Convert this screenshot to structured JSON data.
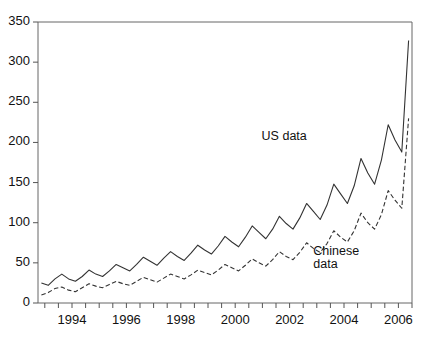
{
  "chart_data": {
    "type": "line",
    "title": "",
    "xlabel": "",
    "ylabel": "",
    "xlim": [
      1992.75,
      2006.5
    ],
    "ylim": [
      0,
      350
    ],
    "grid": false,
    "legend_position": "inline-annotation",
    "y_ticks": [
      0,
      50,
      100,
      150,
      200,
      250,
      300,
      350
    ],
    "y_tick_labels": [
      "0",
      "50",
      "100",
      "150",
      "200",
      "250",
      "300",
      "350"
    ],
    "x_ticks": [
      1994,
      1996,
      1998,
      2000,
      2002,
      2004,
      2006
    ],
    "x_tick_labels": [
      "1994",
      "1996",
      "1998",
      "2000",
      "2002",
      "2004",
      "2006"
    ],
    "x_minor_ticks": [
      1993,
      1993.5,
      1994.5,
      1995,
      1995.5,
      1996.5,
      1997,
      1997.5,
      1998.5,
      1999,
      1999.5,
      2000.5,
      2001,
      2001.5,
      2002.5,
      2003,
      2003.5,
      2004.5,
      2005,
      2005.5,
      2006.5
    ],
    "x": [
      1992.875,
      1993.125,
      1993.375,
      1993.625,
      1993.875,
      1994.125,
      1994.375,
      1994.625,
      1994.875,
      1995.125,
      1995.375,
      1995.625,
      1995.875,
      1996.125,
      1996.375,
      1996.625,
      1996.875,
      1997.125,
      1997.375,
      1997.625,
      1997.875,
      1998.125,
      1998.375,
      1998.625,
      1998.875,
      1999.125,
      1999.375,
      1999.625,
      1999.875,
      2000.125,
      2000.375,
      2000.625,
      2000.875,
      2001.125,
      2001.375,
      2001.625,
      2001.875,
      2002.125,
      2002.375,
      2002.625,
      2002.875,
      2003.125,
      2003.375,
      2003.625,
      2003.875,
      2004.125,
      2004.375,
      2004.625,
      2004.875,
      2005.125,
      2005.375,
      2005.625,
      2005.875,
      2006.125,
      2006.375
    ],
    "series": [
      {
        "name": "US data",
        "style": "solid",
        "color": "#333333",
        "values": [
          25,
          22,
          30,
          36,
          30,
          27,
          33,
          41,
          36,
          33,
          40,
          48,
          44,
          40,
          48,
          57,
          52,
          47,
          56,
          64,
          58,
          53,
          62,
          72,
          66,
          61,
          71,
          83,
          76,
          70,
          82,
          96,
          88,
          80,
          92,
          108,
          99,
          92,
          106,
          124,
          114,
          104,
          122,
          148,
          136,
          124,
          146,
          180,
          162,
          148,
          178,
          222,
          203,
          188,
          327
        ]
      },
      {
        "name": "Chinese data",
        "style": "dashed",
        "color": "#333333",
        "values": [
          10,
          13,
          18,
          20,
          16,
          14,
          19,
          24,
          21,
          19,
          23,
          27,
          24,
          22,
          27,
          32,
          29,
          26,
          31,
          36,
          33,
          30,
          35,
          41,
          38,
          35,
          41,
          48,
          44,
          40,
          47,
          55,
          50,
          46,
          54,
          64,
          58,
          54,
          63,
          75,
          68,
          63,
          74,
          90,
          82,
          76,
          90,
          112,
          100,
          92,
          110,
          140,
          128,
          118,
          230
        ]
      }
    ],
    "annotations": [
      {
        "text": "US data",
        "x": 2002.0,
        "y": 205
      },
      {
        "text": "Chinese\ndata",
        "x": 2003.9,
        "y": 62
      }
    ]
  },
  "axes": {
    "frame_color": "#555555",
    "tick_color": "#555555"
  }
}
